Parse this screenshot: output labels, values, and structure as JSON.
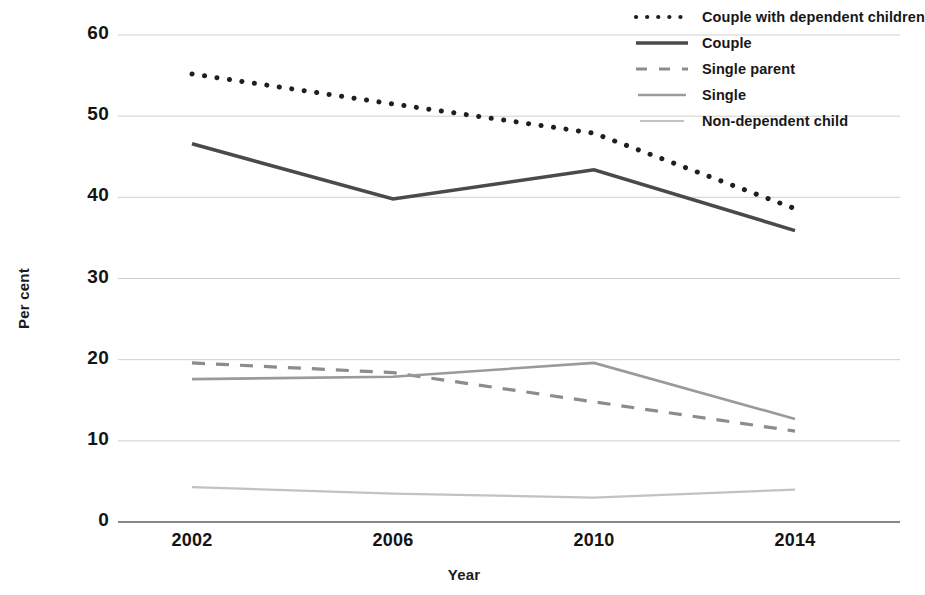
{
  "chart_data": {
    "type": "line",
    "title": "",
    "xlabel": "Year",
    "ylabel": "Per cent",
    "x": [
      2002,
      2006,
      2010,
      2014
    ],
    "xticklabels": [
      "2002",
      "2006",
      "2010",
      "2014"
    ],
    "yticklabels": [
      "0",
      "10",
      "20",
      "30",
      "40",
      "50",
      "60"
    ],
    "yticks": [
      0,
      10,
      20,
      30,
      40,
      50,
      60
    ],
    "ylim": [
      0,
      62
    ],
    "xlim": [
      2001,
      2015
    ],
    "grid": "horizontal",
    "legend_position": "top-right",
    "series": [
      {
        "name": "Couple with dependent children",
        "style": "dotted",
        "color": "#1f1f1f",
        "values": [
          55.2,
          51.5,
          47.9,
          38.6
        ]
      },
      {
        "name": "Couple",
        "style": "solid",
        "color": "#4a4a4a",
        "values": [
          46.6,
          39.8,
          43.4,
          35.9
        ]
      },
      {
        "name": "Single parent",
        "style": "dashed",
        "color": "#8c8c8c",
        "values": [
          19.6,
          18.4,
          14.8,
          11.2
        ]
      },
      {
        "name": "Single",
        "style": "solid-light",
        "color": "#9a9a9a",
        "values": [
          17.6,
          17.9,
          19.6,
          12.7
        ]
      },
      {
        "name": "Non-dependent child",
        "style": "solid-faint",
        "color": "#c2c2c2",
        "values": [
          4.3,
          3.5,
          3.0,
          4.0
        ]
      }
    ]
  },
  "axes": {
    "ylabel": "Per cent",
    "xlabel": "Year",
    "yticks": [
      "60",
      "50",
      "40",
      "30",
      "20",
      "10",
      "0"
    ],
    "xticks": [
      "2002",
      "2006",
      "2010",
      "2014"
    ]
  },
  "legend": {
    "items": [
      {
        "label": "Couple with dependent children",
        "key": "dotted-line-key"
      },
      {
        "label": "Couple",
        "key": "solid-line-key"
      },
      {
        "label": "Single parent",
        "key": "dashed-line-key"
      },
      {
        "label": "Single",
        "key": "solid-light-line-key"
      },
      {
        "label": "Non-dependent child",
        "key": "solid-faint-line-key"
      }
    ]
  }
}
